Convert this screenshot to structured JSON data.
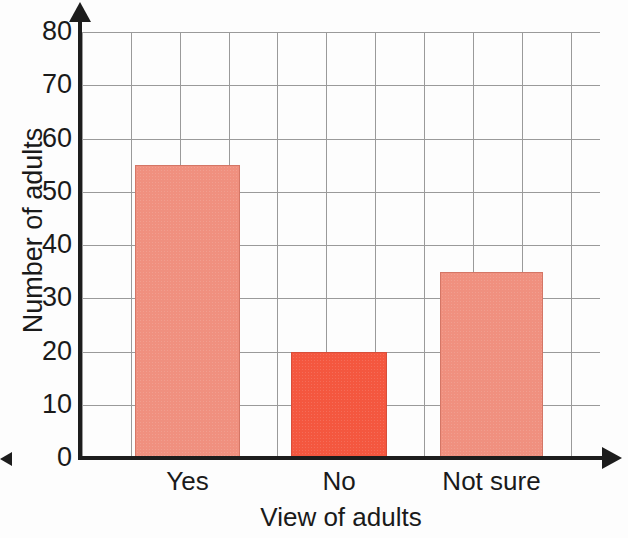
{
  "chart_data": {
    "type": "bar",
    "title": "",
    "xlabel": "View of adults",
    "ylabel": "Number of adults",
    "categories": [
      "Yes",
      "No",
      "Not sure"
    ],
    "values": [
      55,
      20,
      35
    ],
    "ylim": [
      0,
      80
    ],
    "ytick_labels": [
      "0",
      "10",
      "20",
      "30",
      "40",
      "50",
      "60",
      "70",
      "80"
    ],
    "ytick_values": [
      0,
      10,
      20,
      30,
      40,
      50,
      60,
      70,
      80
    ],
    "y_step": 10,
    "grid": "both",
    "legend": "none",
    "bar_colors": [
      "#f0907f",
      "#f4573f",
      "#f0907f"
    ],
    "axis_color": "#1d1d1d",
    "grid_color": "#9a9a9a",
    "series": [
      {
        "name": "Number of adults",
        "values": [
          55,
          20,
          35
        ]
      }
    ]
  },
  "axes": {
    "y_axis_name": "number-of-adults-axis",
    "x_axis_name": "view-of-adults-axis"
  }
}
